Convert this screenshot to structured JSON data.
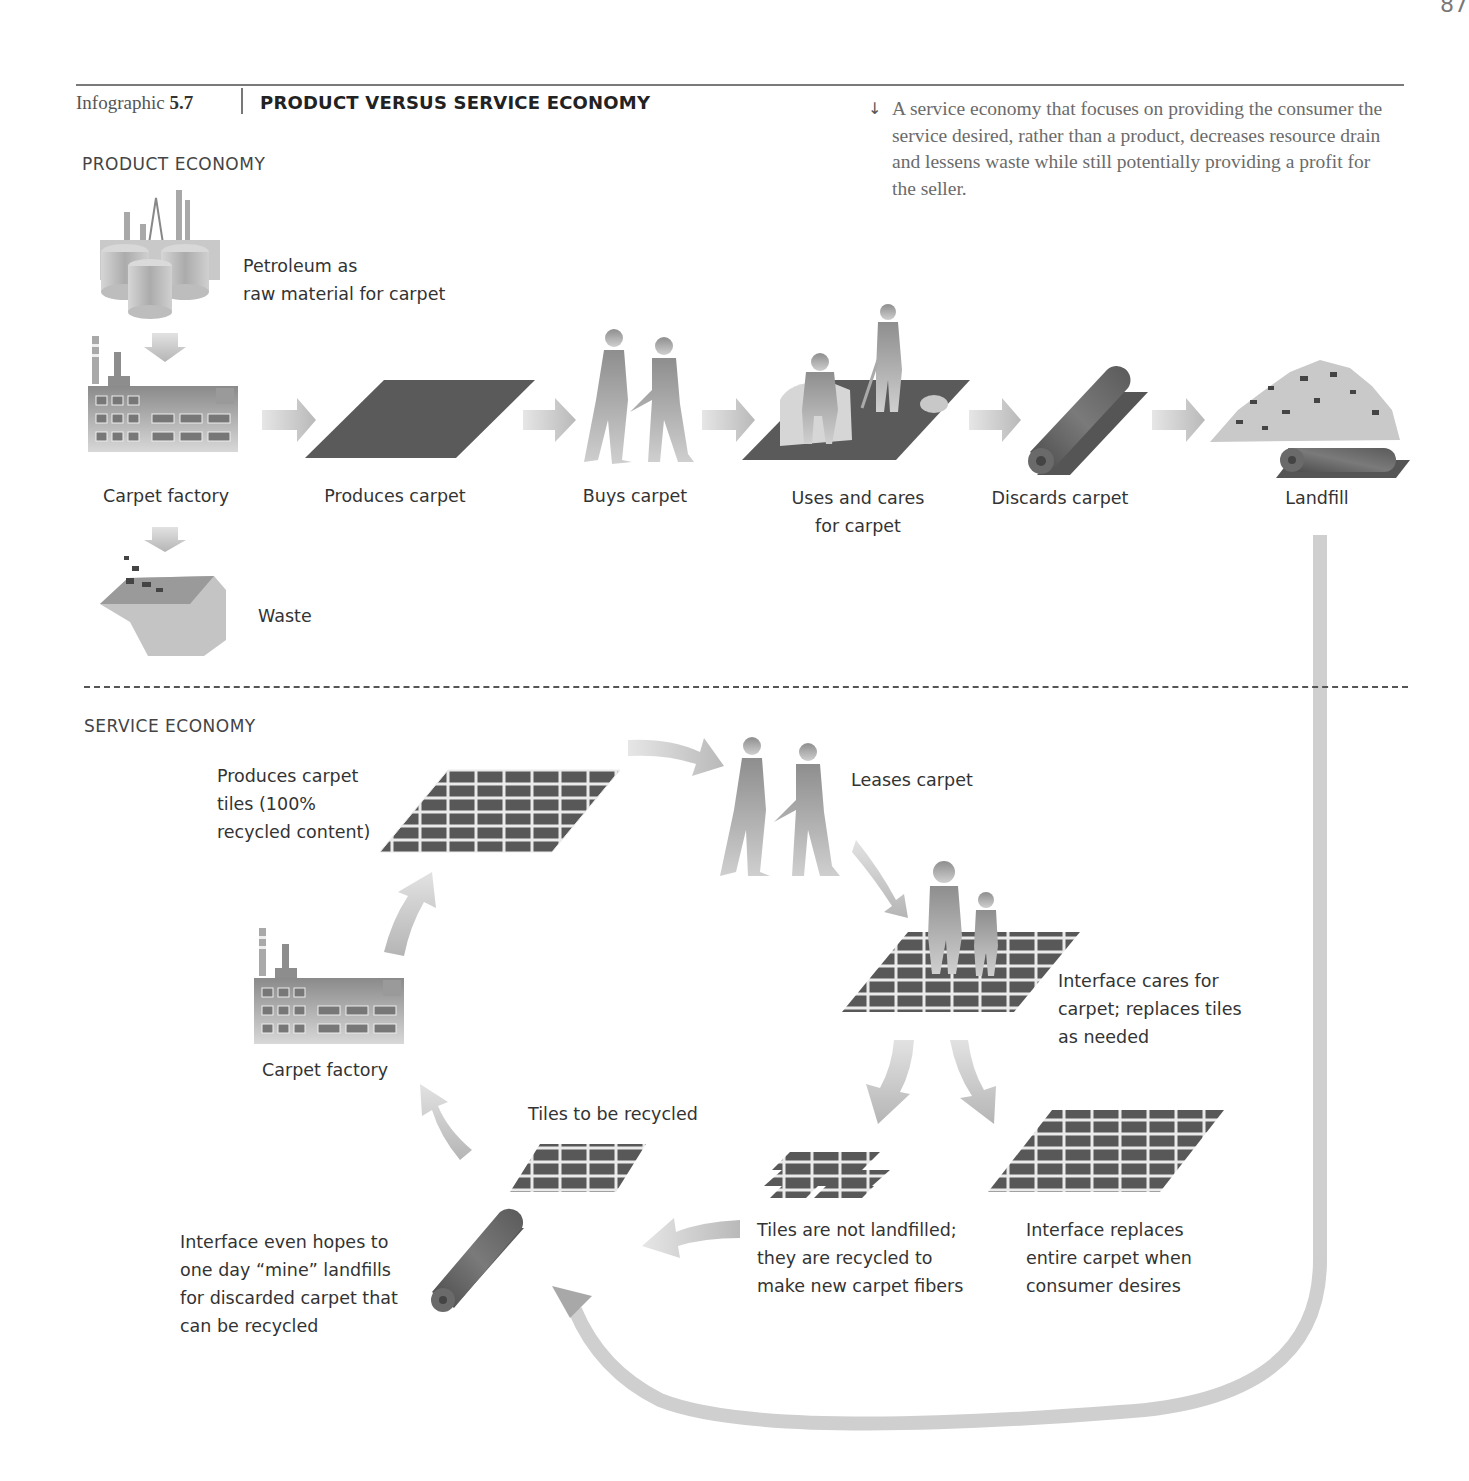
{
  "page_number": "87",
  "header": {
    "label": "Infographic",
    "number": "5.7",
    "title": "PRODUCT VERSUS SERVICE ECONOMY"
  },
  "caption": {
    "icon": "arrow-down-icon",
    "arrow_glyph": "↓",
    "text": "A service economy that focuses on providing the consumer the service desired, rather than a product, decreases resource drain and lessens waste while still potentially providing a profit for the seller."
  },
  "product_economy": {
    "title": "PRODUCT ECONOMY",
    "raw_material": "Petroleum as\nraw material for carpet",
    "steps": [
      {
        "label": "Carpet factory",
        "icon": "factory-icon"
      },
      {
        "label": "Produces carpet",
        "icon": "carpet-icon"
      },
      {
        "label": "Buys carpet",
        "icon": "handshake-people-icon"
      },
      {
        "label": "Uses and cares\nfor carpet",
        "icon": "vacuum-carpet-icon"
      },
      {
        "label": "Discards carpet",
        "icon": "rolled-carpet-icon"
      },
      {
        "label": "Landfill",
        "icon": "landfill-icon"
      }
    ],
    "waste_label": "Waste"
  },
  "service_economy": {
    "title": "SERVICE ECONOMY",
    "produces_tiles": "Produces carpet\ntiles (100%\nrecycled content)",
    "leases": "Leases carpet",
    "cares": "Interface cares for\ncarpet; replaces tiles\nas needed",
    "factory": "Carpet factory",
    "tiles_recycled": "Tiles to be recycled",
    "not_landfilled": "Tiles are not landfilled;\nthey are recycled to\nmake new carpet fibers",
    "replaces_entire": "Interface replaces\nentire carpet when\nconsumer desires",
    "mine_landfills": "Interface even hopes to\none day “mine” landfills\nfor discarded carpet that\ncan be recycled"
  },
  "colors": {
    "carpet": "#555555",
    "tile_dark": "#4a4a4a",
    "arrow": "#c8c8c8",
    "silhouette": "#9a9a9a",
    "rule": "#7a7a7a",
    "caption_text": "#6b6b6b"
  }
}
